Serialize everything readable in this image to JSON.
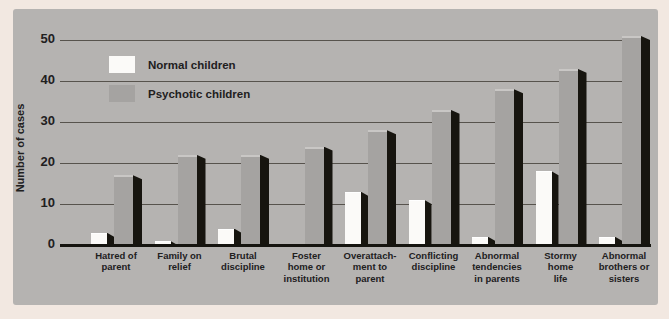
{
  "chart_data": {
    "type": "bar",
    "title": "",
    "categories": [
      "Hatred of parent",
      "Family on relief",
      "Brutal discipline",
      "Foster home or institution",
      "Overattachment to parent",
      "Conflicting discipline",
      "Abnormal tendencies in parents",
      "Stormy home life",
      "Abnormal brothers or sisters"
    ],
    "categories_display": [
      "Hatred of\nparent",
      "Family on\nrelief",
      "Brutal\ndiscipline",
      "Foster\nhome or\ninstitution",
      "Overattach-\nment to\nparent",
      "Conflicting\ndiscipline",
      "Abnormal\ntendencies\nin parents",
      "Stormy\nhome\nlife",
      "Abnormal\nbrothers or\nsisters"
    ],
    "series": [
      {
        "name": "Normal children",
        "color": "#fbfaf8",
        "values": [
          3,
          1,
          4,
          0,
          13,
          11,
          2,
          18,
          2
        ]
      },
      {
        "name": "Psychotic children",
        "color": "#a5a3a1",
        "values": [
          17,
          22,
          22,
          24,
          28,
          33,
          38,
          43,
          51
        ]
      }
    ],
    "xlabel": "",
    "ylabel": "Number of cases",
    "ylim": [
      0,
      50
    ],
    "yticks": [
      0,
      10,
      20,
      30,
      40,
      50
    ],
    "grid": true,
    "legend_position": "upper-left",
    "colors": {
      "page_bg": "#f2e8e1",
      "panel_bg": "#b5b3b1",
      "bar_shadow": "#17150f",
      "gridline": "#57534d",
      "axis_line": "#15140f",
      "text": "#21201e"
    }
  }
}
